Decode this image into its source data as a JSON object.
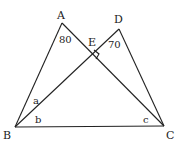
{
  "diagram": {
    "points": {
      "A": {
        "label": "A",
        "x": 62,
        "y": 23
      },
      "D": {
        "label": "D",
        "x": 119,
        "y": 29
      },
      "E": {
        "label": "E",
        "x": 92,
        "y": 56
      },
      "B": {
        "label": "B",
        "x": 15,
        "y": 127
      },
      "C": {
        "label": "C",
        "x": 164,
        "y": 126
      }
    },
    "segments": [
      [
        "A",
        "B"
      ],
      [
        "A",
        "C"
      ],
      [
        "B",
        "D"
      ],
      [
        "D",
        "C"
      ],
      [
        "B",
        "C"
      ]
    ],
    "angles": {
      "A": "80",
      "D": "70",
      "ABD": "a",
      "DBC": "b",
      "ACB": "c"
    },
    "right_angle_at": "E",
    "colors": {
      "stroke": "#222222",
      "background": "#ffffff"
    }
  }
}
